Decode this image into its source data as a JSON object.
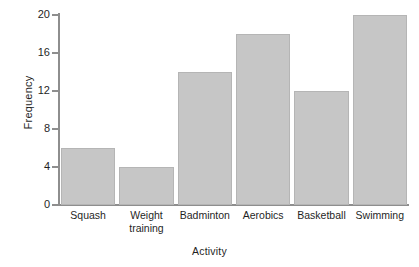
{
  "chart_data": {
    "type": "bar",
    "title": "",
    "subtitle": "",
    "xlabel": "Activity",
    "ylabel": "Frequency",
    "categories": [
      "Squash",
      "Weight training",
      "Badminton",
      "Aerobics",
      "Basketball",
      "Swimming"
    ],
    "category_lines": [
      [
        "Squash"
      ],
      [
        "Weight",
        "training"
      ],
      [
        "Badminton"
      ],
      [
        "Aerobics"
      ],
      [
        "Basketball"
      ],
      [
        "Swimming"
      ]
    ],
    "values": [
      6,
      4,
      14,
      18,
      12,
      20
    ],
    "ylim": [
      0,
      20
    ],
    "xlim": [
      0,
      6
    ],
    "y_ticks": [
      0,
      4,
      8,
      12,
      16,
      20
    ],
    "y_tick_labels": [
      "0",
      "4",
      "8",
      "12",
      "16",
      "20"
    ],
    "grid": false,
    "legend": null,
    "bar_color": "#c6c6c6",
    "bar_edge_color": "#b5b5b5",
    "axis_color": "#8e8e8e",
    "text_color": "#1f1f1f",
    "background_color": "#ffffff",
    "annotations": []
  },
  "axis": {
    "y_title": "Frequency",
    "x_title": "Activity"
  },
  "ticks": {
    "y": [
      "0",
      "4",
      "8",
      "12",
      "16",
      "20"
    ]
  },
  "bars": [
    {
      "label": "Squash",
      "line1": "Squash",
      "line2": "",
      "value": 6
    },
    {
      "label": "Weight training",
      "line1": "Weight",
      "line2": "training",
      "value": 4
    },
    {
      "label": "Badminton",
      "line1": "Badminton",
      "line2": "",
      "value": 14
    },
    {
      "label": "Aerobics",
      "line1": "Aerobics",
      "line2": "",
      "value": 18
    },
    {
      "label": "Basketball",
      "line1": "Basketball",
      "line2": "",
      "value": 12
    },
    {
      "label": "Swimming",
      "line1": "Swimming",
      "line2": "",
      "value": 20
    }
  ]
}
